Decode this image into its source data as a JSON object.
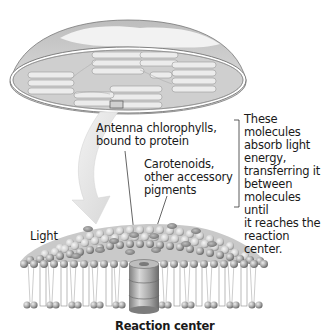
{
  "figure": {
    "organelle": "chloroplast-cutaway",
    "membrane": "thylakoid-membrane-photosystem"
  },
  "labels": {
    "antenna": "Antenna chlorophylls,\nbound to protein",
    "carotenoids": "Carotenoids,\nother accessory\npigments",
    "bracket_note": "These molecules\nabsorb light\nenergy,\ntransferring it\nbetween\nmolecules until\nit reaches the\nreaction center.",
    "light": "Light",
    "reaction_center": "Reaction center"
  },
  "colors": {
    "background": "#ffffff",
    "text": "#1a1a1a",
    "shell": "#c8c8c8",
    "shell_dark": "#8a8a8a",
    "stroma": "#d9d9d9",
    "granum": "#ececec",
    "sphere": "#b0b0b0",
    "sphere_dark": "#777777",
    "arrow": "#e2e2e2"
  }
}
